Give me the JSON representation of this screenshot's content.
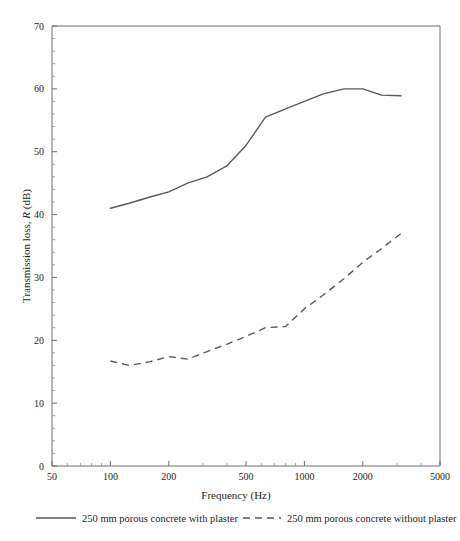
{
  "chart_data": {
    "type": "line",
    "title": "",
    "xlabel": "Frequency (Hz)",
    "ylabel": "Transmission loss, R (dB)",
    "ylabel_parts": {
      "prefix": "Transmission loss, ",
      "italic": "R",
      "suffix": " (dB)"
    },
    "xscale": "log",
    "xlim": [
      50,
      5000
    ],
    "ylim": [
      0,
      70
    ],
    "grid": false,
    "legend_position": "bottom",
    "x_ticks": [
      50,
      100,
      200,
      500,
      1000,
      2000,
      5000
    ],
    "x_tick_labels": [
      "50",
      "100",
      "200",
      "500",
      "1000",
      "2000",
      "5000"
    ],
    "x_minor_ticks": [
      60,
      70,
      80,
      90,
      300,
      400,
      600,
      700,
      800,
      900,
      3000,
      4000
    ],
    "y_ticks": [
      0,
      10,
      20,
      30,
      40,
      50,
      60,
      70
    ],
    "y_tick_labels": [
      "0",
      "10",
      "20",
      "30",
      "40",
      "50",
      "60",
      "70"
    ],
    "y_minor_tick_step": 2,
    "series": [
      {
        "name": "250 mm porous concrete with plaster",
        "style": "solid",
        "color": "#58595b",
        "x": [
          100,
          125,
          160,
          200,
          250,
          315,
          400,
          500,
          630,
          800,
          1000,
          1250,
          1600,
          2000,
          2500,
          3150
        ],
        "y": [
          41.0,
          41.8,
          42.8,
          43.6,
          45.0,
          46.0,
          47.8,
          51.0,
          55.5,
          56.8,
          58.0,
          59.2,
          60.0,
          60.0,
          59.0,
          58.9
        ]
      },
      {
        "name": "250 mm porous concrete without plaster",
        "style": "dashed",
        "color": "#58595b",
        "x": [
          100,
          125,
          160,
          200,
          250,
          315,
          400,
          500,
          630,
          800,
          1000,
          1250,
          1600,
          2000,
          2500,
          3150
        ],
        "y": [
          16.7,
          16.0,
          16.6,
          17.4,
          17.0,
          18.2,
          19.4,
          20.6,
          22.0,
          22.2,
          25.0,
          27.2,
          29.8,
          32.4,
          34.6,
          37.0
        ]
      }
    ]
  },
  "legend": {
    "entries": [
      {
        "label": "250 mm porous concrete with plaster",
        "style": "solid"
      },
      {
        "label": "250 mm porous concrete without plaster",
        "style": "dashed"
      }
    ]
  }
}
